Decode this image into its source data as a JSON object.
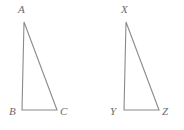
{
  "figure": {
    "width": 184,
    "height": 130,
    "background_color": "#ffffff",
    "stroke_color": "#8a8a8a",
    "label_color": "#6b6b6b",
    "stroke_width": 1.1,
    "shapes": [
      {
        "name": "triangle-abc",
        "vertices": [
          {
            "label": "A",
            "x": 24,
            "y": 22,
            "label_x": 18,
            "label_y": 4
          },
          {
            "label": "B",
            "x": 22,
            "y": 110,
            "label_x": 9,
            "label_y": 106
          },
          {
            "label": "C",
            "x": 57,
            "y": 110,
            "label_x": 60,
            "label_y": 106
          }
        ],
        "points": "24,22 22,110 57,110"
      },
      {
        "name": "triangle-xyz",
        "vertices": [
          {
            "label": "X",
            "x": 126,
            "y": 22,
            "label_x": 121,
            "label_y": 4
          },
          {
            "label": "Y",
            "x": 124,
            "y": 110,
            "label_x": 110,
            "label_y": 106
          },
          {
            "label": "Z",
            "x": 159,
            "y": 110,
            "label_x": 162,
            "label_y": 106
          }
        ],
        "points": "126,22 124,110 159,110"
      }
    ]
  }
}
